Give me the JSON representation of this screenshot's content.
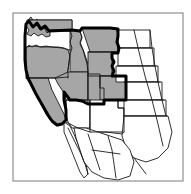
{
  "figure": {
    "kind": "range-map",
    "title": "Distribution map of the western United States",
    "caption": "",
    "region": "Western North America",
    "background_color": "#ffffff",
    "frame_color": "#7a7a7a",
    "shaded_fill_color": "#a6a6a6",
    "unshaded_fill_color": "#ffffff",
    "state_border_color": "#1a1a1a",
    "range_outline_color": "#000000",
    "state_border_width": "0.9",
    "range_outline_width": "3.0",
    "frame_width": "1.0"
  },
  "legend": {
    "shaded_meaning": "Shaded: within range",
    "unshaded_meaning": "Unshaded: outside range"
  },
  "shaded_states": [
    "Washington",
    "Oregon",
    "California",
    "Idaho",
    "Nevada",
    "Montana",
    "Wyoming",
    "Utah",
    "Colorado"
  ],
  "unshaded_states": [
    "Arizona",
    "New Mexico",
    "North Dakota",
    "South Dakota",
    "Nebraska",
    "Kansas",
    "Oklahoma",
    "Texas",
    "Baja California",
    "Sonora",
    "Chihuahua",
    "Coahuila"
  ],
  "map_geometry": {
    "frame": {
      "x": 13,
      "y": 13,
      "width": 170,
      "height": 168
    },
    "shapes": [
      {
        "name": "washington",
        "shaded": true,
        "d": "M 28,20 L 31,17 L 34,22 L 37,19 L 40,25 L 43,22 L 45,28 L 48,25 L 50,31 L 72,31 L 72,20 L 30,20 Z M 28,20 L 26,26 L 29,30 L 27,34 L 31,36 L 34,33 L 38,36 L 42,34 L 46,37 L 50,36 L 50,31 Z"
      },
      {
        "name": "washington-body",
        "shaded": true,
        "d": "M 26,25 L 29,22 L 33,28 L 36,24 L 40,30 L 44,27 L 47,33 L 50,30 L 72,30 L 72,20 L 27,20 Z"
      },
      {
        "name": "oregon",
        "shaded": true,
        "d": "M 26,48 L 29,45 L 32,47 L 36,45 L 40,47 L 46,46 L 52,47 L 58,47 L 64,48 L 68,50 L 70,56 L 69,63 L 68,70 L 66,76 L 62,78 L 56,78 L 48,78 L 40,78 L 32,78 L 26,78 Z"
      },
      {
        "name": "california",
        "shaded": true,
        "d": "M 26,78 L 34,78 L 42,78 L 48,78 L 50,84 L 52,90 L 55,96 L 58,102 L 61,108 L 64,114 L 66,120 L 62,124 L 58,126 L 54,124 L 50,120 L 46,114 L 43,108 L 40,102 L 37,96 L 34,90 L 31,84 Z"
      },
      {
        "name": "idaho",
        "shaded": true,
        "d": "M 70,30 L 76,30 L 80,32 L 82,37 L 80,42 L 82,47 L 84,52 L 86,58 L 88,64 L 88,72 L 78,72 L 70,72 Z"
      },
      {
        "name": "nevada",
        "shaded": true,
        "d": "M 68,72 L 88,72 L 88,100 L 82,100 L 76,100 L 70,100 L 66,96 L 62,90 L 58,84 L 55,78 Z"
      },
      {
        "name": "montana",
        "shaded": true,
        "d": "M 82,28 L 92,28 L 104,28 L 116,28 L 118,34 L 117,40 L 118,46 L 118,52 L 108,52 L 98,52 L 90,52 L 88,46 L 86,40 L 84,34 Z"
      },
      {
        "name": "wyoming",
        "shaded": true,
        "d": "M 88,52 L 100,52 L 112,52 L 112,76 L 100,76 L 88,76 Z"
      },
      {
        "name": "utah",
        "shaded": true,
        "d": "M 88,74 L 100,74 L 100,86 L 104,86 L 104,104 L 94,104 L 88,104 Z"
      },
      {
        "name": "colorado",
        "shaded": true,
        "d": "M 100,76 L 114,76 L 126,76 L 126,100 L 112,100 L 100,100 Z"
      },
      {
        "name": "arizona",
        "shaded": false,
        "d": "M 66,100 L 78,100 L 90,100 L 90,128 L 80,128 L 72,128 L 68,122 L 66,114 Z"
      },
      {
        "name": "new-mexico",
        "shaded": false,
        "d": "M 90,100 L 104,100 L 118,100 L 118,108 L 124,108 L 124,132 L 106,132 L 90,132 Z"
      },
      {
        "name": "north-dakota",
        "shaded": false,
        "d": "M 118,30 L 134,30 L 150,30 L 150,48 L 134,48 L 118,48 Z"
      },
      {
        "name": "south-dakota",
        "shaded": false,
        "d": "M 118,48 L 136,48 L 154,48 L 154,66 L 136,66 L 118,66 Z"
      },
      {
        "name": "nebraska",
        "shaded": false,
        "d": "M 116,66 L 136,66 L 158,66 L 158,82 L 136,82 L 116,82 Z"
      },
      {
        "name": "kansas",
        "shaded": false,
        "d": "M 126,82 L 144,82 L 162,82 L 162,100 L 144,100 L 126,100 Z"
      },
      {
        "name": "oklahoma",
        "shaded": false,
        "d": "M 124,100 L 144,100 L 166,100 L 166,116 L 144,116 L 124,116 Z"
      },
      {
        "name": "texas",
        "shaded": false,
        "d": "M 124,116 L 146,116 L 168,116 L 172,132 L 168,148 L 158,158 L 146,162 L 134,158 L 126,148 L 122,136 Z"
      },
      {
        "name": "baja-california",
        "shaded": false,
        "d": "M 64,122 L 70,126 L 74,134 L 78,144 L 82,154 L 86,164 L 88,174 L 84,178 L 80,172 L 76,162 L 72,152 L 68,142 L 64,132 Z"
      },
      {
        "name": "mexico-mainland",
        "shaded": false,
        "d": "M 74,128 L 86,128 L 98,132 L 110,136 L 122,140 L 130,150 L 134,162 L 130,176 L 118,180 L 104,178 L 92,172 L 84,162 L 80,150 L 76,138 Z"
      }
    ],
    "range_outline_path": "M 26,24 L 29,21 L 33,27 L 37,23 L 41,29 L 45,26 L 49,31 L 72,30 L 80,31 L 82,28 L 96,28 L 110,28 L 118,29 L 118,36 L 117,42 L 119,48 L 118,53 L 112,53 L 112,58 L 114,62 L 112,66 L 114,71 L 112,76 L 126,76 L 126,90 L 126,100 L 112,100 L 104,100 L 104,104 L 94,104 L 88,104 L 82,101 L 76,100 L 70,100 L 67,96 L 64,92 L 64,100 L 66,110 L 66,120 L 62,124 L 57,125 L 52,121 L 48,115 L 44,108 L 40,101 L 36,94 L 32,86 L 28,78 L 26,70 L 25,60 L 25,48 L 25,36 Z",
    "state_border_lines": [
      {
        "name": "wa-or",
        "d": "M 26,47 L 34,46 L 42,47 L 52,47 L 62,48 L 70,50"
      },
      {
        "name": "or-ca-nv",
        "d": "M 26,78 L 40,78 L 56,78 L 68,77"
      },
      {
        "name": "id-wa-or-east",
        "d": "M 70,30 L 72,36 L 70,42 L 72,48 L 70,54 L 69,62 L 68,70 L 68,78"
      },
      {
        "name": "id-mt",
        "d": "M 80,31 L 82,38 L 80,44 L 83,50 L 85,57 L 87,64 L 88,72"
      },
      {
        "name": "mt-wy",
        "d": "M 88,52 L 100,52 L 112,52 L 118,52"
      },
      {
        "name": "wy-co",
        "d": "M 88,76 L 100,76 L 112,76"
      },
      {
        "name": "nv-ut",
        "d": "M 88,72 L 88,88 L 88,104"
      },
      {
        "name": "ut-co",
        "d": "M 100,76 L 100,88 L 104,88 L 104,104"
      },
      {
        "name": "nv-ca-az",
        "d": "M 64,92 L 66,100 L 66,112 L 66,120"
      },
      {
        "name": "nv-az-south",
        "d": "M 66,100 L 78,100 L 88,101"
      },
      {
        "name": "az-nm",
        "d": "M 90,100 L 90,116 L 90,132"
      },
      {
        "name": "co-nm-border",
        "d": "M 104,100 L 116,100 L 126,100"
      },
      {
        "name": "nd-sd",
        "d": "M 118,48 L 134,48 L 152,48"
      },
      {
        "name": "sd-ne",
        "d": "M 118,66 L 136,66 L 156,66"
      },
      {
        "name": "ne-ks",
        "d": "M 124,82 L 142,82 L 160,82"
      },
      {
        "name": "ks-ok",
        "d": "M 126,100 L 146,100 L 164,100"
      },
      {
        "name": "ok-tx",
        "d": "M 124,116 L 146,116 L 167,116"
      },
      {
        "name": "plains-east-edge",
        "d": "M 150,30 L 152,48 L 155,66 L 158,82 L 162,100 L 166,116"
      },
      {
        "name": "diagonal-meridian",
        "d": "M 134,30 L 139,52 L 145,76 L 152,100 L 158,124 L 163,146"
      },
      {
        "name": "tx-nm-west",
        "d": "M 118,100 L 118,108 L 124,108 L 124,132"
      },
      {
        "name": "mexico-border",
        "d": "M 66,122 L 78,128 L 90,132 L 106,132 L 122,134 L 124,132"
      },
      {
        "name": "baja-inner",
        "d": "M 68,128 L 74,140 L 80,152 L 85,164 L 88,174"
      },
      {
        "name": "mex-state-1",
        "d": "M 88,134 L 92,146 L 96,158 L 100,170"
      },
      {
        "name": "mex-state-2",
        "d": "M 108,136 L 112,150 L 114,164 L 116,178"
      },
      {
        "name": "mex-state-3",
        "d": "M 92,150 L 106,152 L 120,154"
      },
      {
        "name": "tx-south",
        "d": "M 134,158 L 140,166 L 146,174"
      }
    ]
  }
}
